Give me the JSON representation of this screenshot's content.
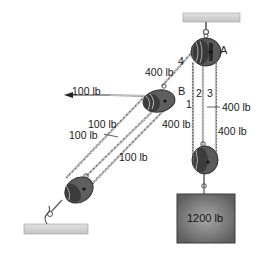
{
  "diagram": {
    "colors": {
      "support_fill": "#cfcfcf",
      "pulley_dark": "#3d3d3d",
      "pulley_mid": "#6b6b6b",
      "rope": "#8a8a8a",
      "block_fill": "#6a6a6a",
      "block_highlight": "#a8a8a8"
    },
    "pulleys": [
      {
        "id": "A",
        "label": "A"
      },
      {
        "id": "B",
        "label": "B"
      },
      {
        "id": "lower-right",
        "label": ""
      },
      {
        "id": "lower-left",
        "label": ""
      }
    ],
    "rope_labels": {
      "seg1": "1",
      "seg2": "2",
      "seg3": "3",
      "seg4": "4"
    },
    "forces": {
      "upper_left_400": "400 lb",
      "pull_100": "100 lb",
      "right_400_upper": "400 lb",
      "mid_400": "400 lb",
      "right_400_lower": "400 lb",
      "left_100_a": "100 lb",
      "left_100_b": "100 lb",
      "lower_100": "100 lb"
    },
    "load": {
      "label": "1200 lb"
    }
  }
}
